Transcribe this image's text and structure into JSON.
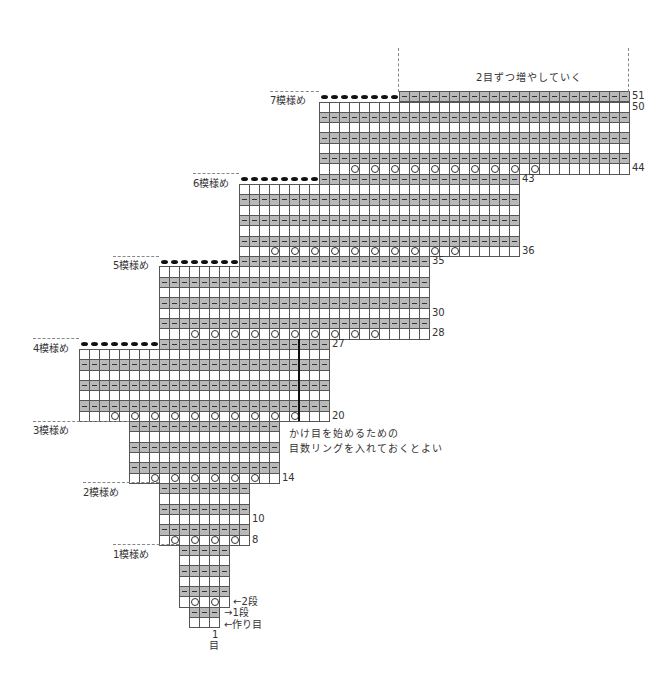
{
  "title_note": "2目ずつ増やしていく",
  "side_note": [
    "かけ目を始めるための",
    "目数リングを入れておくとよい"
  ],
  "bottom_labels": {
    "row2": "←2段",
    "row1": "→1段",
    "cast_on": "←作り目",
    "stitch_number": "1",
    "stitch_unit": "目"
  },
  "pattern_labels": [
    "1模様め",
    "2模様め",
    "3模様め",
    "4模様め",
    "5模様め",
    "6模様め",
    "7模様め"
  ],
  "row_numbers": [
    {
      "row": 51,
      "text": "51"
    },
    {
      "row": 50,
      "text": "50"
    },
    {
      "row": 44,
      "text": "44"
    },
    {
      "row": 43,
      "text": "43"
    },
    {
      "row": 36,
      "text": "36"
    },
    {
      "row": 35,
      "text": "35"
    },
    {
      "row": 30,
      "text": "30"
    },
    {
      "row": 28,
      "text": "28"
    },
    {
      "row": 27,
      "text": "27"
    },
    {
      "row": 20,
      "text": "20"
    },
    {
      "row": 14,
      "text": "14"
    },
    {
      "row": 10,
      "text": "10"
    },
    {
      "row": 8,
      "text": "8"
    }
  ],
  "legend_symbols": {
    "gray_dash": "purl (裏目)",
    "white": "knit (表目)",
    "circle": "yarn over (かけ目)",
    "bold_dot": "bind off (伏せ目)"
  },
  "grid": {
    "cell_w": 10,
    "row_h": 10.31,
    "row0_top": 617,
    "rows": [
      {
        "row": 0,
        "x0": 189,
        "n": 3,
        "type": "white"
      },
      {
        "row": 1,
        "x0": 189,
        "n": 3,
        "type": "gray"
      },
      {
        "row": 2,
        "x0": 179,
        "n": 5,
        "type": "circle",
        "circles": [
          1,
          3
        ]
      },
      {
        "row": 3,
        "x0": 179,
        "n": 5,
        "type": "gray"
      },
      {
        "row": 4,
        "x0": 179,
        "n": 5,
        "type": "white"
      },
      {
        "row": 5,
        "x0": 179,
        "n": 5,
        "type": "gray"
      },
      {
        "row": 6,
        "x0": 179,
        "n": 5,
        "type": "white"
      },
      {
        "row": 7,
        "x0": 179,
        "n": 5,
        "type": "gray"
      },
      {
        "row": 8,
        "x0": 159,
        "n": 9,
        "type": "circle",
        "circles": [
          1,
          3,
          5,
          7
        ]
      },
      {
        "row": 9,
        "x0": 159,
        "n": 9,
        "type": "gray"
      },
      {
        "row": 10,
        "x0": 159,
        "n": 9,
        "type": "white"
      },
      {
        "row": 11,
        "x0": 159,
        "n": 9,
        "type": "gray"
      },
      {
        "row": 12,
        "x0": 159,
        "n": 9,
        "type": "white"
      },
      {
        "row": 13,
        "x0": 159,
        "n": 9,
        "type": "gray"
      },
      {
        "row": 14,
        "x0": 129,
        "n": 15,
        "type": "circle",
        "circles": [
          2,
          4,
          6,
          8,
          10,
          12
        ]
      },
      {
        "row": 15,
        "x0": 129,
        "n": 15,
        "type": "gray"
      },
      {
        "row": 16,
        "x0": 129,
        "n": 15,
        "type": "white"
      },
      {
        "row": 17,
        "x0": 129,
        "n": 15,
        "type": "gray"
      },
      {
        "row": 18,
        "x0": 129,
        "n": 15,
        "type": "white"
      },
      {
        "row": 19,
        "x0": 129,
        "n": 15,
        "type": "gray"
      },
      {
        "row": 20,
        "x0": 79,
        "n": 25,
        "type": "circle",
        "circles": [
          3,
          5,
          7,
          9,
          11,
          13,
          15,
          17,
          19,
          21
        ]
      },
      {
        "row": 21,
        "x0": 79,
        "n": 25,
        "type": "gray"
      },
      {
        "row": 22,
        "x0": 79,
        "n": 25,
        "type": "white"
      },
      {
        "row": 23,
        "x0": 79,
        "n": 25,
        "type": "gray"
      },
      {
        "row": 24,
        "x0": 79,
        "n": 25,
        "type": "white"
      },
      {
        "row": 25,
        "x0": 79,
        "n": 25,
        "type": "gray"
      },
      {
        "row": 26,
        "x0": 79,
        "n": 25,
        "type": "white"
      },
      {
        "row": 27,
        "x0": 79,
        "n": 25,
        "type": "bindoff",
        "dots": 8
      },
      {
        "row": 28,
        "x0": 159,
        "n": 27,
        "type": "circle",
        "circles": [
          3,
          5,
          7,
          9,
          11,
          13,
          15,
          17,
          19,
          21
        ]
      },
      {
        "row": 29,
        "x0": 159,
        "n": 27,
        "type": "gray"
      },
      {
        "row": 30,
        "x0": 159,
        "n": 27,
        "type": "white"
      },
      {
        "row": 31,
        "x0": 159,
        "n": 27,
        "type": "gray"
      },
      {
        "row": 32,
        "x0": 159,
        "n": 27,
        "type": "white"
      },
      {
        "row": 33,
        "x0": 159,
        "n": 27,
        "type": "gray"
      },
      {
        "row": 34,
        "x0": 159,
        "n": 27,
        "type": "white"
      },
      {
        "row": 35,
        "x0": 159,
        "n": 27,
        "type": "bindoff",
        "dots": 8
      },
      {
        "row": 36,
        "x0": 239,
        "n": 28,
        "type": "circle",
        "circles": [
          3,
          5,
          7,
          9,
          11,
          13,
          15,
          17,
          19,
          21
        ]
      },
      {
        "row": 37,
        "x0": 239,
        "n": 28,
        "type": "gray"
      },
      {
        "row": 38,
        "x0": 239,
        "n": 28,
        "type": "white"
      },
      {
        "row": 39,
        "x0": 239,
        "n": 28,
        "type": "gray"
      },
      {
        "row": 40,
        "x0": 239,
        "n": 28,
        "type": "white"
      },
      {
        "row": 41,
        "x0": 239,
        "n": 28,
        "type": "gray"
      },
      {
        "row": 42,
        "x0": 239,
        "n": 28,
        "type": "white"
      },
      {
        "row": 43,
        "x0": 239,
        "n": 28,
        "type": "bindoff",
        "dots": 8
      },
      {
        "row": 44,
        "x0": 319,
        "n": 31,
        "type": "circle",
        "circles": [
          3,
          5,
          7,
          9,
          11,
          13,
          15,
          17,
          19,
          21
        ]
      },
      {
        "row": 45,
        "x0": 319,
        "n": 31,
        "type": "gray"
      },
      {
        "row": 46,
        "x0": 319,
        "n": 31,
        "type": "white"
      },
      {
        "row": 47,
        "x0": 319,
        "n": 31,
        "type": "gray"
      },
      {
        "row": 48,
        "x0": 319,
        "n": 31,
        "type": "white"
      },
      {
        "row": 49,
        "x0": 319,
        "n": 31,
        "type": "gray"
      },
      {
        "row": 50,
        "x0": 319,
        "n": 31,
        "type": "white"
      },
      {
        "row": 51,
        "x0": 319,
        "n": 31,
        "type": "bindoff",
        "dots": 8
      }
    ],
    "marker_line": {
      "x": 298,
      "row_from": 20,
      "row_to": 27
    },
    "pattern_label_pos": [
      {
        "x": 113,
        "boundary_row": 8,
        "dash_x0": 113,
        "dash_x1": 179
      },
      {
        "x": 83,
        "boundary_row": 14,
        "dash_x0": 83,
        "dash_x1": 159
      },
      {
        "x": 33,
        "boundary_row": 20,
        "dash_x0": 33,
        "dash_x1": 129
      },
      {
        "x": 33,
        "boundary_row": 28,
        "dash_x0": 33,
        "dash_x1": 79
      },
      {
        "x": 113,
        "boundary_row": 36,
        "dash_x0": 113,
        "dash_x1": 159
      },
      {
        "x": 193,
        "boundary_row": 44,
        "dash_x0": 193,
        "dash_x1": 239
      },
      {
        "x": 270,
        "boundary_row": 52,
        "dash_x0": 270,
        "dash_x1": 319
      }
    ]
  }
}
